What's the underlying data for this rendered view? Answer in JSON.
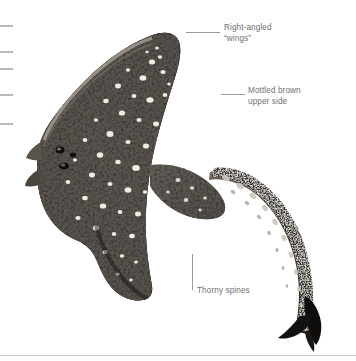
{
  "figure": {
    "background_color": "#ffffff",
    "body_color_dark": "#1c1a18",
    "body_color_mid": "#57504a",
    "body_color_light": "#cfc7bd",
    "spot_color": "#f2efe9",
    "label_color": "#6f6f6f",
    "leader_color": "#9a9a9a",
    "tick_color": "#b9b9b9",
    "rule_color": "#c8c8c8"
  },
  "callouts": [
    {
      "id": "right-angled-wings",
      "text": "Right-angled\n“wings”",
      "text_x": 224,
      "text_y": 23,
      "leader": {
        "type": "horizontal",
        "x": 186,
        "y": 32,
        "length": 34
      }
    },
    {
      "id": "mottled-brown-upper-side",
      "text": "Mottled brown\nupper side",
      "text_x": 248,
      "text_y": 86,
      "leader": {
        "type": "horizontal",
        "x": 221,
        "y": 94,
        "length": 24
      }
    },
    {
      "id": "thorny-spines",
      "text": "Thorny spines",
      "text_x": 197,
      "text_y": 286,
      "leader": {
        "type": "vertical",
        "x": 192,
        "y": 254,
        "length": 36
      }
    }
  ],
  "ticks": [
    {
      "y": 25
    },
    {
      "y": 51
    },
    {
      "y": 68
    },
    {
      "y": 94
    },
    {
      "y": 123
    }
  ],
  "footer_rule": {
    "y": 355
  }
}
